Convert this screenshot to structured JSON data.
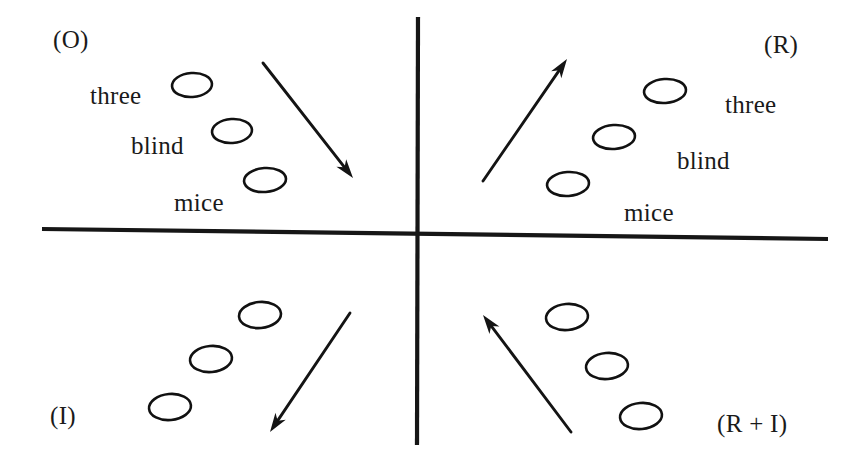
{
  "figure": {
    "background_color": "#ffffff",
    "ink_color": "#141414",
    "width": 864,
    "height": 464
  },
  "axes": {
    "vertical": {
      "x": 418,
      "y_top": 17,
      "y_bottom": 445
    },
    "horizontal": {
      "x_left": 42,
      "y_left": 229,
      "x_right": 828,
      "y_right": 239
    }
  },
  "quadrants": [
    {
      "id": "top-left",
      "label": "(O)",
      "label_x": 53,
      "label_y": 27,
      "arrow_direction": "down-right",
      "words": [
        "three",
        "blind",
        "mice"
      ],
      "word_side": "left",
      "ellipses": [
        {
          "cx": 192,
          "cy": 85,
          "rx": 20,
          "ry": 12,
          "rot": -4
        },
        {
          "cx": 232,
          "cy": 131,
          "rx": 20,
          "ry": 12,
          "rot": -4
        },
        {
          "cx": 265,
          "cy": 180,
          "rx": 21,
          "ry": 12,
          "rot": -4
        }
      ],
      "word_positions": [
        {
          "text": "three",
          "x": 90,
          "y": 83
        },
        {
          "text": "blind",
          "x": 131,
          "y": 133
        },
        {
          "text": "mice",
          "x": 174,
          "y": 190
        }
      ],
      "arrow": {
        "x1": 263,
        "y1": 63,
        "x2": 353,
        "y2": 178
      }
    },
    {
      "id": "top-right",
      "label": "(R)",
      "label_x": 764,
      "label_y": 32,
      "arrow_direction": "up-right",
      "words": [
        "three",
        "blind",
        "mice"
      ],
      "word_side": "right",
      "ellipses": [
        {
          "cx": 665,
          "cy": 91,
          "rx": 21,
          "ry": 12,
          "rot": -4
        },
        {
          "cx": 614,
          "cy": 137,
          "rx": 21,
          "ry": 12,
          "rot": -4
        },
        {
          "cx": 568,
          "cy": 184,
          "rx": 21,
          "ry": 12,
          "rot": -4
        }
      ],
      "word_positions": [
        {
          "text": "three",
          "x": 725,
          "y": 92
        },
        {
          "text": "blind",
          "x": 677,
          "y": 148
        },
        {
          "text": "mice",
          "x": 624,
          "y": 200
        }
      ],
      "arrow": {
        "x1": 483,
        "y1": 181,
        "x2": 567,
        "y2": 59
      }
    },
    {
      "id": "bottom-left",
      "label": "(I)",
      "label_x": 50,
      "label_y": 403,
      "arrow_direction": "down-left",
      "words": [],
      "word_side": "none",
      "ellipses": [
        {
          "cx": 260,
          "cy": 315,
          "rx": 21,
          "ry": 13,
          "rot": -5
        },
        {
          "cx": 211,
          "cy": 359,
          "rx": 21,
          "ry": 13,
          "rot": -5
        },
        {
          "cx": 170,
          "cy": 407,
          "rx": 21,
          "ry": 13,
          "rot": -5
        }
      ],
      "word_positions": [],
      "arrow": {
        "x1": 350,
        "y1": 313,
        "x2": 270,
        "y2": 432
      }
    },
    {
      "id": "bottom-right",
      "label": "(R + I)",
      "label_x": 717,
      "label_y": 411,
      "arrow_direction": "up-left",
      "words": [],
      "word_side": "none",
      "ellipses": [
        {
          "cx": 567,
          "cy": 317,
          "rx": 21,
          "ry": 13,
          "rot": -5
        },
        {
          "cx": 607,
          "cy": 366,
          "rx": 21,
          "ry": 13,
          "rot": -5
        },
        {
          "cx": 641,
          "cy": 416,
          "rx": 21,
          "ry": 13,
          "rot": -5
        }
      ],
      "word_positions": [],
      "arrow": {
        "x1": 571,
        "y1": 432,
        "x2": 483,
        "y2": 315
      }
    }
  ]
}
